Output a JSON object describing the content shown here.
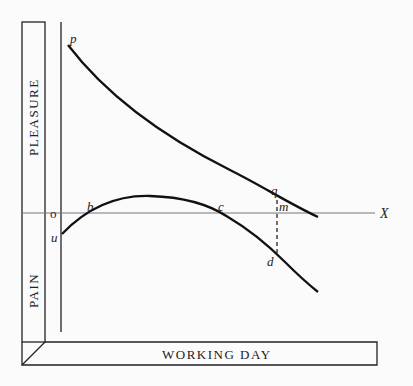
{
  "diagram": {
    "axes": {
      "vertical_upper_label": "PLEASURE",
      "vertical_lower_label": "PAIN",
      "horizontal_label": "WORKING DAY",
      "x_axis_label": "X",
      "origin_label": "o"
    },
    "points": {
      "p": "p",
      "q": "q",
      "u": "u",
      "b": "b",
      "c": "c",
      "m": "m",
      "d": "d"
    },
    "curves": [
      {
        "name": "pleasure-of-wages-curve",
        "from": "p",
        "through": "q",
        "description": "Declining utility of produce"
      },
      {
        "name": "pain-of-labour-curve",
        "from": "u",
        "through": [
          "b",
          "c",
          "d"
        ],
        "description": "Disutility of labour, rising above axis between b and c"
      }
    ],
    "colors": {
      "line": "#111111",
      "axis": "#555555",
      "background": "#fbfbfb"
    }
  }
}
